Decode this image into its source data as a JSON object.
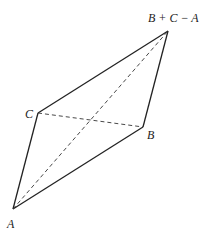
{
  "diagram": {
    "title": "",
    "vertices": {
      "A": {
        "label": "A",
        "x": 13,
        "y": 209
      },
      "B": {
        "label": "B",
        "x": 143,
        "y": 127
      },
      "C": {
        "label": "C",
        "x": 38,
        "y": 113
      },
      "D": {
        "label": "B + C − A",
        "x": 168,
        "y": 31
      }
    },
    "solid_edges": [
      [
        "A",
        "B"
      ],
      [
        "A",
        "C"
      ],
      [
        "C",
        "D"
      ],
      [
        "B",
        "D"
      ]
    ],
    "dashed_edges": [
      [
        "A",
        "D"
      ],
      [
        "C",
        "B"
      ]
    ],
    "colors": {
      "stroke": "#222222",
      "background": "#ffffff"
    }
  }
}
